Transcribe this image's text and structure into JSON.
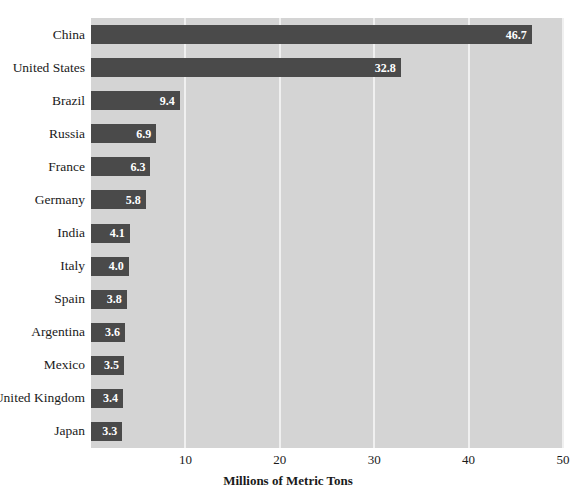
{
  "chart_data": {
    "type": "bar",
    "orientation": "horizontal",
    "title": "",
    "subtitle": "",
    "xlabel": "Millions of Metric Tons",
    "ylabel": "",
    "xlim": [
      0,
      50
    ],
    "xticks": [
      10,
      20,
      30,
      40,
      50
    ],
    "xtick_labels": [
      "10",
      "20",
      "30",
      "40",
      "50"
    ],
    "grid": "vertical",
    "legend": "none",
    "categories": [
      "China",
      "United States",
      "Brazil",
      "Russia",
      "France",
      "Germany",
      "India",
      "Italy",
      "Spain",
      "Argentina",
      "Mexico",
      "United Kingdom",
      "Japan"
    ],
    "values": [
      46.7,
      32.8,
      9.4,
      6.9,
      6.3,
      5.8,
      4.1,
      4.0,
      3.8,
      3.6,
      3.5,
      3.4,
      3.3
    ],
    "value_labels": [
      "46.7",
      "32.8",
      "9.4",
      "6.9",
      "6.3",
      "5.8",
      "4.1",
      "4.0",
      "3.8",
      "3.6",
      "3.5",
      "3.4",
      "3.3"
    ],
    "colors": {
      "bar": "#4a4a4a",
      "plot_background": "#d4d4d4",
      "gridline": "#f0f0f0",
      "value_label": "#ffffff",
      "text": "#1a1a1a",
      "page_background": "#ffffff"
    }
  }
}
